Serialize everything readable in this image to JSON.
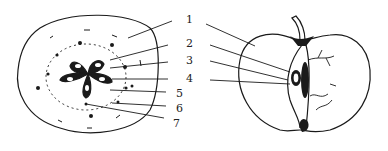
{
  "figure": {
    "ink_color": "#1a1a1a",
    "background": "#ffffff"
  },
  "labels": [
    {
      "id": "1",
      "text": "1",
      "x": 186,
      "y": 14
    },
    {
      "id": "2",
      "text": "2",
      "x": 186,
      "y": 38
    },
    {
      "id": "3",
      "text": "3",
      "x": 186,
      "y": 55
    },
    {
      "id": "4",
      "text": "4",
      "x": 186,
      "y": 73
    },
    {
      "id": "5",
      "text": "5",
      "x": 176,
      "y": 88
    },
    {
      "id": "6",
      "text": "6",
      "x": 176,
      "y": 103
    },
    {
      "id": "7",
      "text": "7",
      "x": 173,
      "y": 118
    }
  ]
}
